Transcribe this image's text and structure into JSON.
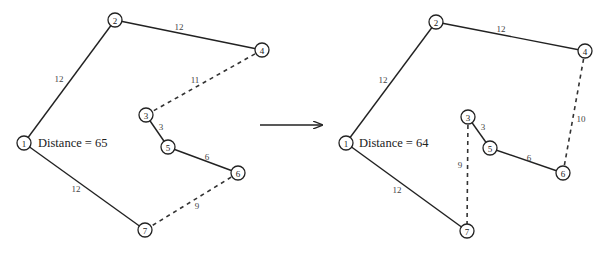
{
  "figure": {
    "arrow": {
      "x1": 260,
      "y1": 125,
      "x2": 322,
      "y2": 125,
      "icon": "right-arrow-icon"
    }
  },
  "graphs": [
    {
      "id": "before",
      "distance_label": "Distance = 65",
      "distance_pos": {
        "x": 38,
        "y": 143
      },
      "nodes": [
        {
          "id": "1",
          "label": "1",
          "x": 24,
          "y": 143
        },
        {
          "id": "2",
          "label": "2",
          "x": 115,
          "y": 20
        },
        {
          "id": "3",
          "label": "3",
          "x": 146,
          "y": 115
        },
        {
          "id": "4",
          "label": "4",
          "x": 262,
          "y": 50
        },
        {
          "id": "5",
          "label": "5",
          "x": 168,
          "y": 147
        },
        {
          "id": "6",
          "label": "6",
          "x": 238,
          "y": 173
        },
        {
          "id": "7",
          "label": "7",
          "x": 145,
          "y": 230
        }
      ],
      "edges": [
        {
          "from": "1",
          "to": "2",
          "weight": "12",
          "style": "solid",
          "label_x": 59,
          "label_y": 79
        },
        {
          "from": "2",
          "to": "4",
          "weight": "12",
          "style": "solid",
          "label_x": 179,
          "label_y": 27
        },
        {
          "from": "4",
          "to": "3",
          "weight": "11",
          "style": "dashed",
          "label_x": 195,
          "label_y": 80
        },
        {
          "from": "3",
          "to": "5",
          "weight": "3",
          "style": "solid",
          "label_x": 161,
          "label_y": 127
        },
        {
          "from": "5",
          "to": "6",
          "weight": "6",
          "style": "solid",
          "label_x": 207,
          "label_y": 157
        },
        {
          "from": "6",
          "to": "7",
          "weight": "9",
          "style": "dashed",
          "label_x": 197,
          "label_y": 206
        },
        {
          "from": "7",
          "to": "1",
          "weight": "12",
          "style": "solid",
          "label_x": 76,
          "label_y": 189
        }
      ]
    },
    {
      "id": "after",
      "distance_label": "Distance = 64",
      "distance_pos": {
        "x": 359,
        "y": 143
      },
      "nodes": [
        {
          "id": "1",
          "label": "1",
          "x": 346,
          "y": 143
        },
        {
          "id": "2",
          "label": "2",
          "x": 436,
          "y": 22
        },
        {
          "id": "3",
          "label": "3",
          "x": 468,
          "y": 117
        },
        {
          "id": "4",
          "label": "4",
          "x": 585,
          "y": 51
        },
        {
          "id": "5",
          "label": "5",
          "x": 490,
          "y": 148
        },
        {
          "id": "6",
          "label": "6",
          "x": 563,
          "y": 173
        },
        {
          "id": "7",
          "label": "7",
          "x": 467,
          "y": 231
        }
      ],
      "edges": [
        {
          "from": "1",
          "to": "2",
          "weight": "12",
          "style": "solid",
          "label_x": 383,
          "label_y": 80
        },
        {
          "from": "2",
          "to": "4",
          "weight": "12",
          "style": "solid",
          "label_x": 501,
          "label_y": 29
        },
        {
          "from": "4",
          "to": "6",
          "weight": "10",
          "style": "dashed",
          "label_x": 581,
          "label_y": 119
        },
        {
          "from": "3",
          "to": "5",
          "weight": "3",
          "style": "solid",
          "label_x": 483,
          "label_y": 127
        },
        {
          "from": "5",
          "to": "6",
          "weight": "6",
          "style": "solid",
          "label_x": 529,
          "label_y": 158
        },
        {
          "from": "3",
          "to": "7",
          "weight": "9",
          "style": "dashed",
          "label_x": 460,
          "label_y": 165
        },
        {
          "from": "7",
          "to": "1",
          "weight": "12",
          "style": "solid",
          "label_x": 397,
          "label_y": 190
        }
      ]
    }
  ],
  "style": {
    "node_radius": 7,
    "stroke_color": "#222222",
    "label_color": "#444444",
    "background": "#ffffff"
  }
}
